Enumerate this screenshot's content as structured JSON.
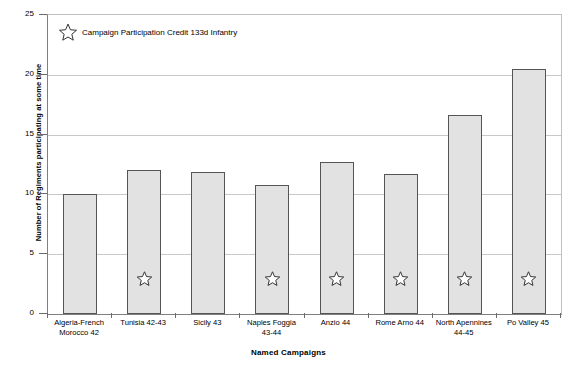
{
  "chart_data": {
    "type": "bar",
    "title": "",
    "xlabel": "Named Campaigns",
    "ylabel": "Number of Regiments participating at some time",
    "ylim": [
      0,
      25
    ],
    "yticks": [
      0,
      5,
      10,
      15,
      20,
      25
    ],
    "grid": true,
    "categories": [
      "Algeria-French Morocco 42",
      "Tunisia 42-43",
      "Sicily 43",
      "Naples Foggia 43-44",
      "Anzio 44",
      "Rome Arno 44",
      "North Apennines 44-45",
      "Po Valley 45"
    ],
    "category_lines": [
      [
        "Algeria-French",
        "Morocco 42"
      ],
      [
        "Tunisia 42-43",
        ""
      ],
      [
        "Sicily 43",
        ""
      ],
      [
        "Naples Foggia",
        "43-44"
      ],
      [
        "Anzio 44",
        ""
      ],
      [
        "Rome Arno 44",
        ""
      ],
      [
        "North Apennines",
        "44-45"
      ],
      [
        "Po Valley 45",
        ""
      ]
    ],
    "values": [
      10.0,
      12.0,
      11.9,
      10.8,
      12.7,
      11.7,
      16.6,
      20.5
    ],
    "series": [
      {
        "name": "Number of Regiments participating at some time",
        "values": [
          10.0,
          12.0,
          11.9,
          10.8,
          12.7,
          11.7,
          16.6,
          20.5
        ]
      }
    ],
    "annotations": {
      "star_marker_value": 3,
      "star_categories": [
        "Tunisia 42-43",
        "Naples Foggia 43-44",
        "Anzio 44",
        "Rome Arno 44",
        "North Apennines 44-45",
        "Po Valley 45"
      ],
      "star_flags": [
        false,
        true,
        false,
        true,
        true,
        true,
        true,
        true
      ]
    },
    "legend": {
      "position": "top-left-inside",
      "entries": [
        {
          "marker": "star",
          "label": "Campaign Participation Credit 133d Infantry"
        }
      ]
    },
    "colors": {
      "bar_fill": "#e2e2e2",
      "bar_border": "#555555",
      "gridline": "#c8c8c8",
      "axis": "#6b6b6b",
      "text": "#000000",
      "background": "#ffffff"
    }
  }
}
